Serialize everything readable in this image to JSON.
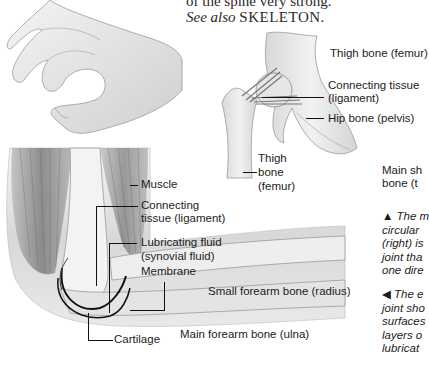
{
  "body_text": {
    "line1": "of the spine very strong.",
    "see_also_prefix": "See also",
    "see_also_ref": "SKELETON",
    "see_also_suffix": "."
  },
  "hip_diagram": {
    "labels": {
      "thigh_bone_femur_top": "Thigh bone (femur)",
      "connecting_tissue_1": "Connecting tissue",
      "connecting_tissue_2": "(ligament)",
      "hip_bone": "Hip bone (pelvis)",
      "thigh_1": "Thigh",
      "thigh_2": "bone",
      "thigh_3": "(femur)"
    }
  },
  "elbow_diagram": {
    "labels": {
      "muscle": "Muscle",
      "connecting_1": "Connecting",
      "connecting_2": "tissue (ligament)",
      "lubricating_1": "Lubricating fluid",
      "lubricating_2": "(synovial fluid)",
      "membrane": "Membrane",
      "radius": "Small forearm bone (radius)",
      "cartilage": "Cartilage",
      "ulna": "Main forearm bone (ulna)"
    }
  },
  "right_column": {
    "main_label_1": "Main sh",
    "main_label_2": "bone (t",
    "caption_up": {
      "marker": "▲",
      "lines": [
        "The m",
        "circular",
        "(right) is",
        "joint tha",
        "one dire"
      ]
    },
    "caption_left": {
      "marker": "◀",
      "lines": [
        "The e",
        "joint sho",
        "surfaces",
        "layers o",
        "lubricat"
      ]
    }
  },
  "colors": {
    "background": "#ffffff",
    "text": "#1c1c1c",
    "bone": "#e8e8e8",
    "muscle": "#8a8a8a"
  }
}
